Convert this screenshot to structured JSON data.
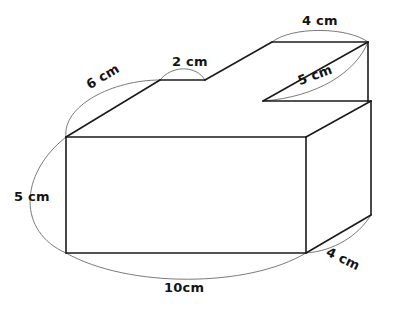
{
  "figure": {
    "kind": "3d-solid-dimension-diagram",
    "background_color": "#ffffff",
    "edge_color": "#1b1b1b",
    "leader_color": "#6b6b6b",
    "label_color": "#141414"
  },
  "labels": {
    "top_step_width": "4 cm",
    "notch_width": "2 cm",
    "top_back_length": "6 cm",
    "step_slant": "5 cm",
    "front_height": "5 cm",
    "depth": "4 cm",
    "base_length": "10cm"
  },
  "dimensions": [
    {
      "name": "top-step-width",
      "value": 4,
      "unit": "cm",
      "text": "4 cm"
    },
    {
      "name": "notch-width",
      "value": 2,
      "unit": "cm",
      "text": "2 cm"
    },
    {
      "name": "top-back-length",
      "value": 6,
      "unit": "cm",
      "text": "6 cm"
    },
    {
      "name": "step-slant",
      "value": 5,
      "unit": "cm",
      "text": "5 cm"
    },
    {
      "name": "front-height",
      "value": 5,
      "unit": "cm",
      "text": "5 cm"
    },
    {
      "name": "depth",
      "value": 4,
      "unit": "cm",
      "text": "4 cm"
    },
    {
      "name": "base-length",
      "value": 10,
      "unit": "cm",
      "text": "10cm"
    }
  ]
}
